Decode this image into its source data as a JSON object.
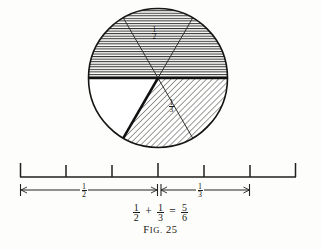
{
  "figure": {
    "caption_prefix": "F",
    "caption_small": "IG.",
    "caption_number": "25",
    "caption_full": "Fig. 25",
    "background_color": "#fdfdfb",
    "ink_color": "#1a1a18"
  },
  "equation": {
    "left_num": "1",
    "left_den": "2",
    "plus": "+",
    "mid_num": "1",
    "mid_den": "3",
    "equals": "=",
    "right_num": "5",
    "right_den": "6",
    "text": "1/2 + 1/3 = 5/6"
  },
  "circle": {
    "center_x": 158,
    "center_y": 78,
    "radius": 70,
    "total_sectors": 6,
    "sector_angle_degrees": 60,
    "labels": [
      {
        "id": "top-half-label",
        "num": "1",
        "den": "2",
        "x": 155,
        "y": 31
      },
      {
        "id": "lower-right-label",
        "num": "1",
        "den": "3",
        "x": 172,
        "y": 104
      }
    ],
    "sectors": [
      {
        "index": 1,
        "start_deg": 180,
        "end_deg": 240,
        "fill": "horizontal-hatch",
        "part_of": "1/2"
      },
      {
        "index": 2,
        "start_deg": 240,
        "end_deg": 300,
        "fill": "horizontal-hatch",
        "part_of": "1/2"
      },
      {
        "index": 3,
        "start_deg": 300,
        "end_deg": 360,
        "fill": "horizontal-hatch",
        "part_of": "1/2"
      },
      {
        "index": 4,
        "start_deg": 0,
        "end_deg": 60,
        "fill": "diagonal-hatch",
        "part_of": "1/3"
      },
      {
        "index": 5,
        "start_deg": 60,
        "end_deg": 120,
        "fill": "diagonal-hatch",
        "part_of": "1/3"
      },
      {
        "index": 6,
        "start_deg": 120,
        "end_deg": 180,
        "fill": "none",
        "part_of": "remainder"
      }
    ]
  },
  "number_line": {
    "left_x": 20,
    "right_x": 296,
    "baseline_y": 177,
    "tick_top_y": 163,
    "tick_count": 7,
    "tick_positions": [
      20,
      66,
      112,
      158,
      204,
      250,
      296
    ],
    "interval_count": 6
  },
  "spans": [
    {
      "id": "half-span",
      "num": "1",
      "den": "2",
      "start_x": 20,
      "end_x": 158,
      "y": 190,
      "label_x": 83,
      "label_y": 183
    },
    {
      "id": "third-span",
      "num": "1",
      "den": "3",
      "start_x": 161,
      "end_x": 250,
      "y": 190,
      "label_x": 199,
      "label_y": 183
    }
  ]
}
